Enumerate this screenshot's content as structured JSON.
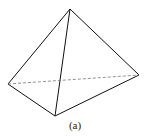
{
  "figure": {
    "caption": "(a)",
    "shape": "tetrahedron",
    "vertices": {
      "apex": [
        70,
        9
      ],
      "left": [
        8,
        84
      ],
      "front": [
        55,
        116
      ],
      "right": [
        139,
        75
      ]
    },
    "edges_solid": [
      [
        "apex",
        "left"
      ],
      [
        "apex",
        "front"
      ],
      [
        "apex",
        "right"
      ],
      [
        "left",
        "front"
      ],
      [
        "front",
        "right"
      ]
    ],
    "edges_hidden": [
      [
        "left",
        "right"
      ]
    ],
    "line_color": "#111111",
    "hidden_line_color": "#777777"
  }
}
